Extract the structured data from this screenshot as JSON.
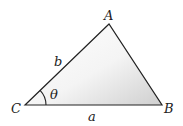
{
  "diagram": {
    "type": "triangle",
    "vertices": {
      "A": {
        "label": "A",
        "x": 109,
        "y": 24
      },
      "B": {
        "label": "B",
        "x": 162,
        "y": 105
      },
      "C": {
        "label": "C",
        "x": 25,
        "y": 105
      }
    },
    "sides": {
      "a": {
        "label": "a",
        "between": [
          "C",
          "B"
        ]
      },
      "b": {
        "label": "b",
        "between": [
          "C",
          "A"
        ]
      }
    },
    "angle": {
      "label": "θ",
      "at": "C"
    },
    "colors": {
      "stroke": "#222222",
      "fill_light": "#ffffff",
      "fill_dark": "#d4d4d4"
    }
  }
}
